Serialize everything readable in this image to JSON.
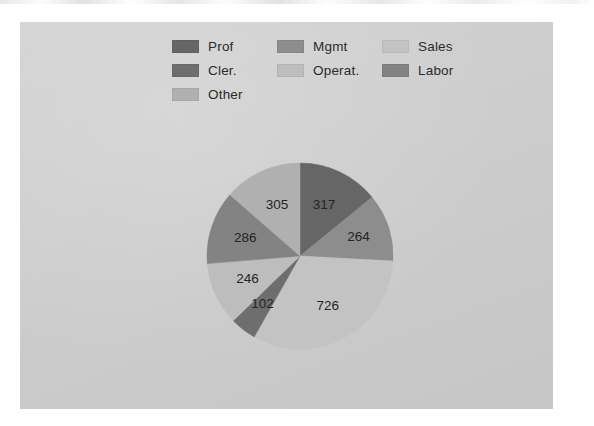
{
  "page": {
    "background_color": "#ffffff",
    "panel_color": "#cfcfcf",
    "has_scan_artifact": true
  },
  "legend": {
    "items": [
      {
        "label": "Prof",
        "color": "#666666"
      },
      {
        "label": "Mgmt",
        "color": "#8d8d8d"
      },
      {
        "label": "Sales",
        "color": "#c3c3c3"
      },
      {
        "label": "Cler.",
        "color": "#6e6e6e"
      },
      {
        "label": "Operat.",
        "color": "#bdbdbd"
      },
      {
        "label": "Labor",
        "color": "#838383"
      },
      {
        "label": "Other",
        "color": "#b0b0b0"
      }
    ]
  },
  "chart_data": {
    "type": "pie",
    "title": "",
    "subtitle": "",
    "xlabel": "",
    "ylabel": "",
    "legend_position": "top",
    "grid": false,
    "total": 2246,
    "start_angle_deg": 0,
    "direction": "clockwise",
    "center": {
      "x": 280,
      "y": 234
    },
    "radius": 93,
    "categories": [
      "Prof",
      "Mgmt",
      "Sales",
      "Cler.",
      "Operat.",
      "Labor",
      "Other"
    ],
    "values": [
      317,
      264,
      726,
      102,
      246,
      286,
      305
    ],
    "colors": [
      "#666666",
      "#8d8d8d",
      "#c3c3c3",
      "#6e6e6e",
      "#bdbdbd",
      "#838383",
      "#b0b0b0"
    ],
    "slices": [
      {
        "label": "Prof",
        "value": 317,
        "value_text": "317",
        "color": "#666666",
        "percent": 14.1,
        "start_deg": 0.0,
        "end_deg": 50.8,
        "label_radius_frac": 0.6
      },
      {
        "label": "Mgmt",
        "value": 264,
        "value_text": "264",
        "color": "#8d8d8d",
        "percent": 11.8,
        "start_deg": 50.8,
        "end_deg": 93.1,
        "label_radius_frac": 0.66
      },
      {
        "label": "Sales",
        "value": 726,
        "value_text": "726",
        "color": "#c3c3c3",
        "percent": 32.3,
        "start_deg": 93.1,
        "end_deg": 209.5,
        "label_radius_frac": 0.62
      },
      {
        "label": "Cler.",
        "value": 102,
        "value_text": "102",
        "color": "#6e6e6e",
        "percent": 4.5,
        "start_deg": 209.5,
        "end_deg": 225.9,
        "label_radius_frac": 0.66
      },
      {
        "label": "Operat.",
        "value": 246,
        "value_text": "246",
        "color": "#bdbdbd",
        "percent": 11.0,
        "start_deg": 225.9,
        "end_deg": 265.3,
        "label_radius_frac": 0.62
      },
      {
        "label": "Labor",
        "value": 286,
        "value_text": "286",
        "color": "#838383",
        "percent": 12.7,
        "start_deg": 265.3,
        "end_deg": 311.1,
        "label_radius_frac": 0.62
      },
      {
        "label": "Other",
        "value": 305,
        "value_text": "305",
        "color": "#b0b0b0",
        "percent": 13.6,
        "start_deg": 311.1,
        "end_deg": 360.0,
        "label_radius_frac": 0.6
      }
    ]
  }
}
